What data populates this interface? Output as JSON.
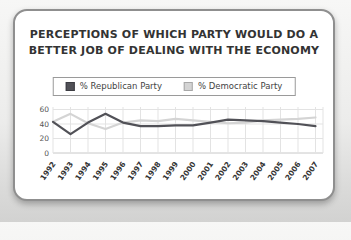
{
  "header": {
    "title_line1": "PERCEPTIONS OF WHICH PARTY WOULD DO A",
    "title_line2": "BETTER JOB OF DEALING WITH THE ECONOMY"
  },
  "legend": {
    "items": [
      {
        "label": "% Republican Party",
        "color": "#515157"
      },
      {
        "label": "% Democratic Party",
        "color": "#d4d4d4"
      }
    ]
  },
  "chart_data": {
    "type": "line",
    "title": "PERCEPTIONS OF WHICH PARTY WOULD DO A BETTER JOB OF DEALING WITH THE ECONOMY",
    "categories": [
      "1992",
      "1993",
      "1994",
      "1995",
      "1996",
      "1997",
      "1998",
      "1999",
      "2000",
      "2001",
      "2002",
      "2003",
      "2004",
      "2005",
      "2006",
      "2007"
    ],
    "series": [
      {
        "name": "% Republican Party",
        "color": "#515157",
        "values": [
          43,
          26,
          42,
          54,
          42,
          37,
          37,
          38,
          38,
          42,
          46,
          45,
          44,
          42,
          40,
          37
        ]
      },
      {
        "name": "% Democratic Party",
        "color": "#d4d4d4",
        "values": [
          43,
          54,
          41,
          33,
          42,
          45,
          44,
          47,
          45,
          43,
          41,
          42,
          45,
          46,
          47,
          49
        ]
      }
    ],
    "xlabel": "",
    "ylabel": "",
    "ylim": [
      0,
      65
    ],
    "yticks": [
      0,
      20,
      40,
      60
    ],
    "grid": true,
    "legend_position": "top"
  }
}
